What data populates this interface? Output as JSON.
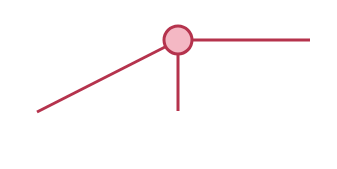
{
  "diagram": {
    "canvas": {
      "width": 337,
      "height": 169,
      "background": "#ffffff"
    },
    "colors": {
      "stroke": "#b5334d",
      "node_fill": "#f4b8c4"
    },
    "node": {
      "id": "center-node",
      "cx": 178,
      "cy": 40,
      "r": 14,
      "stroke_width": 3
    },
    "edges": [
      {
        "id": "edge-left-diagonal",
        "x1": 37,
        "y1": 112,
        "x2": 165,
        "y2": 47,
        "stroke_width": 3
      },
      {
        "id": "edge-right-horizontal",
        "x1": 192,
        "y1": 40,
        "x2": 310,
        "y2": 40,
        "stroke_width": 3
      },
      {
        "id": "edge-down-vertical",
        "x1": 178,
        "y1": 54,
        "x2": 178,
        "y2": 111,
        "stroke_width": 3
      }
    ]
  }
}
